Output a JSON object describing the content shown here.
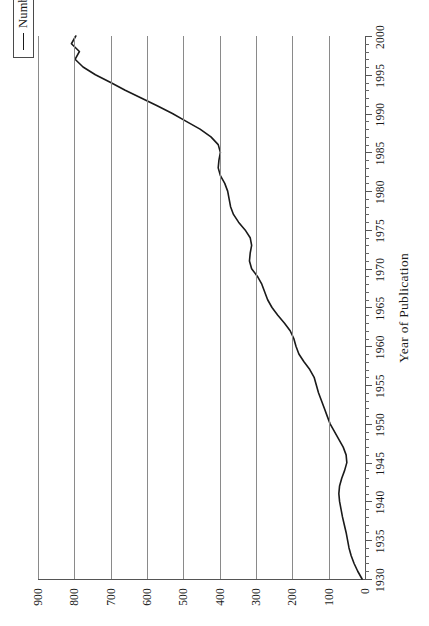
{
  "chart_data": {
    "type": "line",
    "title": "",
    "xlabel": "Year of Publication",
    "ylabel": "",
    "xlim": [
      1930,
      2000
    ],
    "ylim": [
      0,
      900
    ],
    "grid": true,
    "orientation": "rotated-90",
    "legend": {
      "position": "top-right",
      "entries": [
        {
          "label": "Number of References",
          "color": "#1a1a1a",
          "marker": "line"
        }
      ]
    },
    "axes": {
      "x_ticks": [
        1930,
        1935,
        1940,
        1945,
        1950,
        1955,
        1960,
        1965,
        1970,
        1975,
        1980,
        1985,
        1990,
        1995,
        2000
      ],
      "x_tick_labels": [
        "1930",
        "1935",
        "1940",
        "1945",
        "1950",
        "1955",
        "1960",
        "1965",
        "1970",
        "1975",
        "1980",
        "1985",
        "1990",
        "1995",
        "2000"
      ],
      "x_minor_tick_interval": 1,
      "y_ticks": [
        0,
        100,
        200,
        300,
        400,
        500,
        600,
        700,
        800,
        900
      ],
      "y_tick_labels": [
        "0",
        "100",
        "200",
        "300",
        "400",
        "500",
        "600",
        "700",
        "800",
        "900"
      ]
    },
    "series": [
      {
        "name": "Number of References",
        "color": "#1a1a1a",
        "x": [
          1930,
          1931,
          1932,
          1933,
          1934,
          1935,
          1936,
          1937,
          1938,
          1939,
          1940,
          1941,
          1942,
          1943,
          1944,
          1945,
          1946,
          1947,
          1948,
          1949,
          1950,
          1951,
          1952,
          1953,
          1954,
          1955,
          1956,
          1957,
          1958,
          1959,
          1960,
          1961,
          1962,
          1963,
          1964,
          1965,
          1966,
          1967,
          1968,
          1969,
          1970,
          1971,
          1972,
          1973,
          1974,
          1975,
          1976,
          1977,
          1978,
          1979,
          1980,
          1981,
          1982,
          1983,
          1984,
          1985,
          1986,
          1987,
          1988,
          1989,
          1990,
          1991,
          1992,
          1993,
          1994,
          1995,
          1996,
          1997,
          1998,
          1999,
          2000
        ],
        "values": [
          8,
          20,
          30,
          38,
          44,
          48,
          52,
          57,
          62,
          66,
          70,
          72,
          70,
          64,
          56,
          50,
          52,
          60,
          72,
          84,
          96,
          104,
          112,
          120,
          128,
          134,
          140,
          152,
          168,
          182,
          190,
          196,
          206,
          222,
          240,
          256,
          268,
          276,
          284,
          296,
          312,
          318,
          316,
          312,
          316,
          330,
          348,
          362,
          370,
          374,
          378,
          386,
          398,
          404,
          402,
          398,
          404,
          424,
          454,
          492,
          530,
          572,
          616,
          660,
          700,
          742,
          776,
          798,
          786,
          808,
          796
        ]
      }
    ]
  },
  "legend": {
    "label": "Number of References"
  },
  "axis": {
    "category_title": "Year of Publication"
  }
}
